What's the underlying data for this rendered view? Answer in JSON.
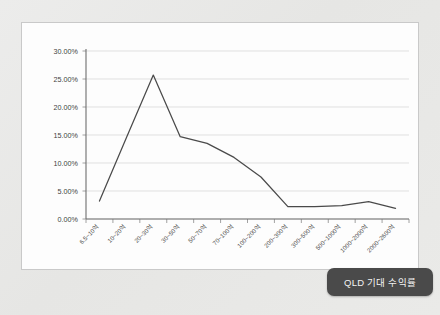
{
  "watermark_text": "",
  "legend": {
    "label": "QLD 기대 수익률"
  },
  "chart_data": {
    "type": "line",
    "title": "",
    "xlabel": "",
    "ylabel": "",
    "ylim": [
      0,
      30
    ],
    "ytick_values": [
      0,
      5,
      10,
      15,
      20,
      25,
      30
    ],
    "ytick_labels": [
      "0.00%",
      "5.00%",
      "10.00%",
      "15.00%",
      "20.00%",
      "25.00%",
      "30.00%"
    ],
    "grid": true,
    "legend_position": "bottom-right",
    "categories": [
      "6.5~10억",
      "10~20억",
      "20~30억",
      "30~50억",
      "50~70억",
      "70~100억",
      "100~200억",
      "200~300억",
      "300~500억",
      "500~1000억",
      "1000~2000억",
      "2000~2600억"
    ],
    "series": [
      {
        "name": "QLD 기대 수익률",
        "values": [
          3.2,
          14.5,
          25.7,
          14.7,
          13.5,
          11.0,
          7.5,
          2.2,
          2.2,
          2.4,
          3.1,
          1.9
        ]
      }
    ]
  },
  "colors": {
    "line": "#4a4a4a",
    "grid": "#d3d3d3",
    "axis": "#6e6e6e",
    "panel_background": "#fdfdfd",
    "page_background": "#eaeae8",
    "legend_background": "#4a4a4a",
    "legend_text": "#f2f2f2"
  }
}
